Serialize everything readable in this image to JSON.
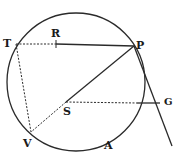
{
  "diagram": {
    "type": "geometry-circle-construction",
    "stroke_color": "#2a2a2a",
    "circle": {
      "cx": 76,
      "cy": 82,
      "r": 69
    },
    "points": {
      "T": {
        "x": 16,
        "y": 44,
        "label": "T"
      },
      "R": {
        "x": 56,
        "y": 44,
        "label": "R"
      },
      "P": {
        "x": 134,
        "y": 46,
        "label": "P"
      },
      "S": {
        "x": 66,
        "y": 102,
        "label": "S"
      },
      "V": {
        "x": 31,
        "y": 132,
        "label": "V"
      },
      "G": {
        "x": 160,
        "y": 103,
        "label": "G"
      },
      "A": {
        "label": "A"
      }
    },
    "segments": [
      {
        "from": "T",
        "to": "R",
        "style": "dashed"
      },
      {
        "from": "R",
        "to": "P",
        "style": "solid"
      },
      {
        "from": "P",
        "to": "S",
        "style": "solid"
      },
      {
        "from": "S",
        "to": "V",
        "style": "dashed"
      },
      {
        "from": "T",
        "to": "V",
        "style": "dashed"
      },
      {
        "from": "S",
        "to": "G",
        "style": "dashed"
      },
      {
        "from": "P",
        "to": "tangent-end",
        "style": "solid"
      }
    ]
  }
}
